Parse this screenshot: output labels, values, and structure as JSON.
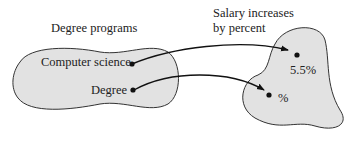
{
  "diagram": {
    "domain_set": {
      "title": "Degree programs",
      "elements": [
        "Computer science",
        "Degree"
      ]
    },
    "codomain_set": {
      "title_line1": "Salary increases",
      "title_line2": "by percent",
      "elements": [
        "5.5%",
        "%"
      ]
    },
    "mappings": [
      {
        "from": "Computer science",
        "to": "5.5%"
      },
      {
        "from": "Degree",
        "to": "%"
      }
    ],
    "colors": {
      "fill": "#e2e2e2",
      "stroke": "#333333",
      "arrow": "#111111"
    }
  }
}
